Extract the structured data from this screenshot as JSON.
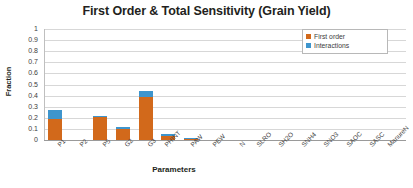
{
  "chart_data": {
    "type": "bar",
    "stacked": true,
    "title": "First Order & Total Sensitivity (Grain Yield)",
    "xlabel": "Parameters",
    "ylabel": "Fraction",
    "ylim": [
      0,
      1
    ],
    "yticks": [
      "0",
      "0.1",
      "0.2",
      "0.3",
      "0.4",
      "0.5",
      "0.6",
      "0.7",
      "0.8",
      "0.9",
      "1"
    ],
    "grid": true,
    "legend_position": "top-right",
    "categories": [
      "P1",
      "P2",
      "P5",
      "G2",
      "G3",
      "PHINT",
      "PAW",
      "PEW",
      "N",
      "SLRO",
      "SH2O",
      "SNH4",
      "SNO3",
      "SAOC",
      "SASC",
      "ManureN"
    ],
    "series": [
      {
        "name": "First order",
        "color": "#d2691b",
        "values": [
          0.19,
          0.0,
          0.21,
          0.095,
          0.39,
          0.035,
          0.005,
          0.0,
          0.0,
          0.0,
          0.0,
          0.0,
          0.0,
          0.0,
          0.0,
          0.0
        ]
      },
      {
        "name": "Interactions",
        "color": "#3e95cd",
        "values": [
          0.08,
          0.0,
          0.005,
          0.025,
          0.055,
          0.015,
          0.008,
          0.0,
          0.0,
          0.0,
          0.0,
          0.0,
          0.0,
          0.0,
          0.0,
          0.0
        ]
      }
    ],
    "totals": [
      0.27,
      0.0,
      0.215,
      0.12,
      0.445,
      0.05,
      0.013,
      0.0,
      0.0,
      0.0,
      0.0,
      0.0,
      0.0,
      0.0,
      0.0,
      0.0
    ]
  }
}
